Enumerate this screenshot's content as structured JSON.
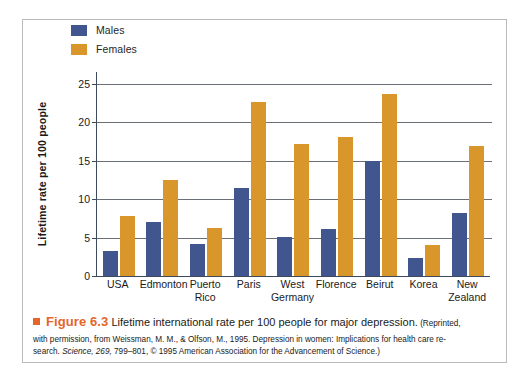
{
  "figure": {
    "number_label": "Figure 6.3",
    "marker_icon": "orange-square-icon",
    "title": "Lifetime international rate per 100 people for major depression.",
    "credit_inline": "(Reprinted,",
    "credit_line2_a": "with permission, from Weissman, M. M., & Olfson, M., 1995. Depression in women: Implications for health care re-",
    "credit_line3_a": "search. ",
    "credit_line3_italic": "Science, 269,",
    "credit_line3_b": " 799–801, © 1995 American Association for the Advancement of Science.)"
  },
  "legend": {
    "position": "top-left",
    "items": [
      {
        "label": "Males",
        "color": "#41568e",
        "swatch_icon": "legend-swatch-icon"
      },
      {
        "label": "Females",
        "color": "#d9972b",
        "swatch_icon": "legend-swatch-icon"
      }
    ]
  },
  "chart_data": {
    "type": "bar",
    "title": "Lifetime international rate per 100 people for major depression",
    "xlabel": "",
    "ylabel": "Lifetime rate per 100 people",
    "ylim": [
      0,
      26.5
    ],
    "yticks": [
      0,
      5,
      10,
      15,
      20,
      25
    ],
    "ytick_labels": [
      "0",
      "5",
      "10",
      "15",
      "20",
      "25"
    ],
    "grid": true,
    "grid_orientation": "horizontal",
    "legend_position": "top-left",
    "categories": [
      "USA",
      "Edmonton",
      "Puerto\nRico",
      "Paris",
      "West\nGermany",
      "Florence",
      "Beirut",
      "Korea",
      "New\nZealand"
    ],
    "series": [
      {
        "name": "Males",
        "color": "#41568e",
        "values": [
          3.2,
          7.0,
          4.1,
          11.4,
          5.1,
          6.1,
          15.0,
          2.3,
          8.2
        ]
      },
      {
        "name": "Females",
        "color": "#d9972b",
        "values": [
          7.8,
          12.5,
          6.3,
          22.6,
          17.1,
          18.0,
          23.7,
          4.0,
          16.9
        ]
      }
    ]
  },
  "colors": {
    "male_blue": "#41568e",
    "female_orange": "#d9972b",
    "accent_orange": "#e4652a",
    "axis": "#3d4a5c",
    "grid": "#6b6f76",
    "frame": "#b9bbbd"
  }
}
